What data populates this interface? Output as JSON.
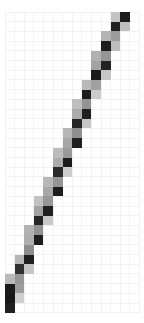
{
  "chart_data": {
    "type": "heatmap",
    "title": "",
    "subtitle": "",
    "xlabel": "",
    "ylabel": "",
    "grid": true,
    "legend": false,
    "legend_position": "none",
    "colormap": "grayscale",
    "colormap_low_color": "#ffffff",
    "colormap_high_color": "#1a1a1a",
    "value_range": [
      0,
      1
    ],
    "ncols": 14,
    "nrows": 31,
    "cell_width": 9.6,
    "cell_height": 9.7,
    "origin_x": 5,
    "origin_y": 12,
    "x": [
      0,
      1,
      2,
      3,
      4,
      5,
      6,
      7,
      8,
      9,
      10,
      11,
      12,
      13
    ],
    "y": [
      0,
      1,
      2,
      3,
      4,
      5,
      6,
      7,
      8,
      9,
      10,
      11,
      12,
      13,
      14,
      15,
      16,
      17,
      18,
      19,
      20,
      21,
      22,
      23,
      24,
      25,
      26,
      27,
      28,
      29,
      30
    ],
    "xticklabels": [],
    "yticklabels": [],
    "cells": [
      {
        "col": 12,
        "row": 0,
        "value": 0.95,
        "color": "#1c1c1c"
      },
      {
        "col": 11,
        "row": 0,
        "value": 0.32,
        "color": "#c3c3c3"
      },
      {
        "col": 12,
        "row": 1,
        "value": 0.34,
        "color": "#c0c0c0"
      },
      {
        "col": 11,
        "row": 1,
        "value": 0.93,
        "color": "#1f1f1f"
      },
      {
        "col": 11,
        "row": 2,
        "value": 0.52,
        "color": "#9b9b9b"
      },
      {
        "col": 10,
        "row": 2,
        "value": 0.4,
        "color": "#b4b4b4"
      },
      {
        "col": 11,
        "row": 3,
        "value": 0.36,
        "color": "#bdbdbd"
      },
      {
        "col": 10,
        "row": 3,
        "value": 0.94,
        "color": "#1e1e1e"
      },
      {
        "col": 10,
        "row": 4,
        "value": 0.55,
        "color": "#959595"
      },
      {
        "col": 9,
        "row": 4,
        "value": 0.42,
        "color": "#b0b0b0"
      },
      {
        "col": 10,
        "row": 5,
        "value": 0.92,
        "color": "#222222"
      },
      {
        "col": 9,
        "row": 5,
        "value": 0.48,
        "color": "#a4a4a4"
      },
      {
        "col": 10,
        "row": 6,
        "value": 0.3,
        "color": "#c7c7c7"
      },
      {
        "col": 9,
        "row": 6,
        "value": 0.96,
        "color": "#1a1a1a"
      },
      {
        "col": 9,
        "row": 7,
        "value": 0.5,
        "color": "#a0a0a0"
      },
      {
        "col": 8,
        "row": 7,
        "value": 0.38,
        "color": "#b9b9b9"
      },
      {
        "col": 9,
        "row": 8,
        "value": 0.28,
        "color": "#cbcbcb"
      },
      {
        "col": 8,
        "row": 8,
        "value": 0.94,
        "color": "#1d1d1d"
      },
      {
        "col": 8,
        "row": 9,
        "value": 0.56,
        "color": "#939393"
      },
      {
        "col": 7,
        "row": 9,
        "value": 0.35,
        "color": "#bfbfbf"
      },
      {
        "col": 8,
        "row": 10,
        "value": 0.93,
        "color": "#202020"
      },
      {
        "col": 7,
        "row": 10,
        "value": 0.45,
        "color": "#aaaaaa"
      },
      {
        "col": 8,
        "row": 11,
        "value": 0.3,
        "color": "#c6c6c6"
      },
      {
        "col": 7,
        "row": 11,
        "value": 0.9,
        "color": "#262626"
      },
      {
        "col": 7,
        "row": 12,
        "value": 0.58,
        "color": "#8f8f8f"
      },
      {
        "col": 6,
        "row": 12,
        "value": 0.4,
        "color": "#b5b5b5"
      },
      {
        "col": 7,
        "row": 13,
        "value": 0.93,
        "color": "#1f1f1f"
      },
      {
        "col": 6,
        "row": 13,
        "value": 0.47,
        "color": "#a6a6a6"
      },
      {
        "col": 6,
        "row": 14,
        "value": 0.52,
        "color": "#9a9a9a"
      },
      {
        "col": 5,
        "row": 14,
        "value": 0.36,
        "color": "#bcbcbc"
      },
      {
        "col": 6,
        "row": 15,
        "value": 0.95,
        "color": "#1b1b1b"
      },
      {
        "col": 5,
        "row": 15,
        "value": 0.44,
        "color": "#acacac"
      },
      {
        "col": 6,
        "row": 16,
        "value": 0.27,
        "color": "#cdcdcd"
      },
      {
        "col": 5,
        "row": 16,
        "value": 0.88,
        "color": "#2b2b2b"
      },
      {
        "col": 5,
        "row": 17,
        "value": 0.55,
        "color": "#959595"
      },
      {
        "col": 4,
        "row": 17,
        "value": 0.38,
        "color": "#b8b8b8"
      },
      {
        "col": 5,
        "row": 18,
        "value": 0.94,
        "color": "#1d1d1d"
      },
      {
        "col": 4,
        "row": 18,
        "value": 0.46,
        "color": "#a8a8a8"
      },
      {
        "col": 4,
        "row": 19,
        "value": 0.53,
        "color": "#989898"
      },
      {
        "col": 3,
        "row": 19,
        "value": 0.33,
        "color": "#c2c2c2"
      },
      {
        "col": 4,
        "row": 20,
        "value": 0.92,
        "color": "#212121"
      },
      {
        "col": 3,
        "row": 20,
        "value": 0.49,
        "color": "#a2a2a2"
      },
      {
        "col": 4,
        "row": 21,
        "value": 0.29,
        "color": "#c9c9c9"
      },
      {
        "col": 3,
        "row": 21,
        "value": 0.9,
        "color": "#252525"
      },
      {
        "col": 3,
        "row": 22,
        "value": 0.57,
        "color": "#919191"
      },
      {
        "col": 2,
        "row": 22,
        "value": 0.41,
        "color": "#b2b2b2"
      },
      {
        "col": 3,
        "row": 23,
        "value": 0.94,
        "color": "#1e1e1e"
      },
      {
        "col": 2,
        "row": 23,
        "value": 0.43,
        "color": "#aeaeae"
      },
      {
        "col": 2,
        "row": 24,
        "value": 0.59,
        "color": "#8d8d8d"
      },
      {
        "col": 2,
        "row": 25,
        "value": 0.93,
        "color": "#1f1f1f"
      },
      {
        "col": 1,
        "row": 25,
        "value": 0.39,
        "color": "#b6b6b6"
      },
      {
        "col": 2,
        "row": 26,
        "value": 0.31,
        "color": "#c5c5c5"
      },
      {
        "col": 1,
        "row": 26,
        "value": 0.86,
        "color": "#303030"
      },
      {
        "col": 1,
        "row": 27,
        "value": 0.54,
        "color": "#979797"
      },
      {
        "col": 0,
        "row": 27,
        "value": 0.37,
        "color": "#bababa"
      },
      {
        "col": 1,
        "row": 28,
        "value": 0.51,
        "color": "#9d9d9d"
      },
      {
        "col": 0,
        "row": 28,
        "value": 0.96,
        "color": "#1a1a1a"
      },
      {
        "col": 1,
        "row": 29,
        "value": 0.26,
        "color": "#cfcfcf"
      },
      {
        "col": 0,
        "row": 29,
        "value": 0.97,
        "color": "#181818"
      },
      {
        "col": 0,
        "row": 30,
        "value": 0.93,
        "color": "#1f1f1f"
      }
    ]
  }
}
